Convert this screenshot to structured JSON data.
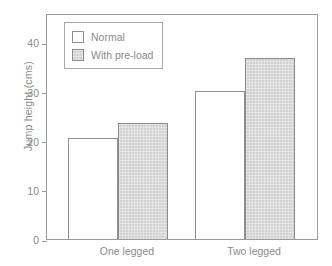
{
  "chart_data": {
    "type": "bar",
    "title": "",
    "xlabel": "",
    "ylabel": "Jump height (cms)",
    "categories": [
      "One legged",
      "Two legged"
    ],
    "series": [
      {
        "name": "Normal",
        "values": [
          20.7,
          30.4
        ],
        "color": "#ffffff"
      },
      {
        "name": "With pre-load",
        "values": [
          23.9,
          37.2
        ],
        "color": "#d2d2d2"
      }
    ],
    "ylim": [
      0,
      46
    ],
    "yticks": [
      0,
      10,
      20,
      30,
      40
    ],
    "ytick_labels": [
      "0",
      "10",
      "20",
      "30",
      "40"
    ],
    "grid": false,
    "legend_position": "top-left"
  },
  "legend": {
    "items": [
      {
        "label": "Normal"
      },
      {
        "label": "With pre-load"
      }
    ]
  },
  "axis": {
    "y_label": "Jump height (cms)",
    "tick_0": "0",
    "tick_10": "10",
    "tick_20": "20",
    "tick_30": "30",
    "tick_40": "40"
  },
  "categories": {
    "one_legged": "One legged",
    "two_legged": "Two legged"
  },
  "colors": {
    "axis": "#9a9a9a",
    "text": "#8a8a8a",
    "bar_normal": "#ffffff",
    "bar_preload": "#d2d2d2",
    "bar_edge": "#8a8a8a"
  }
}
